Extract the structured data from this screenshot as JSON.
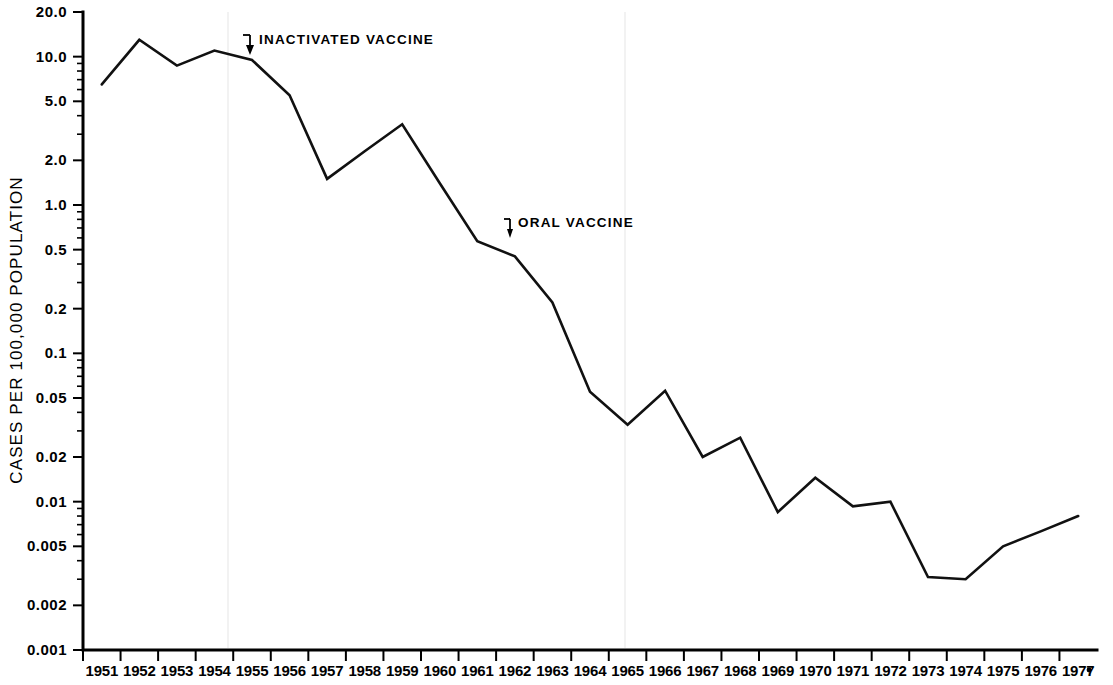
{
  "chart_data": {
    "type": "line",
    "title": "",
    "xlabel": "",
    "ylabel": "CASES PER 100,000 POPULATION",
    "yscale": "log",
    "ylim": [
      0.001,
      20.0
    ],
    "grid": false,
    "legend": null,
    "x": [
      1951,
      1952,
      1953,
      1954,
      1955,
      1956,
      1957,
      1958,
      1959,
      1960,
      1961,
      1962,
      1963,
      1964,
      1965,
      1966,
      1967,
      1968,
      1969,
      1970,
      1971,
      1972,
      1973,
      1974,
      1975,
      1976,
      1977
    ],
    "categories": [
      "1951",
      "1952",
      "1953",
      "1954",
      "1955",
      "1956",
      "1957",
      "1958",
      "1959",
      "1960",
      "1961",
      "1962",
      "1963",
      "1964",
      "1965",
      "1966",
      "1967",
      "1968",
      "1969",
      "1970",
      "1971",
      "1972",
      "1973",
      "1974",
      "1975",
      "1976",
      "1977"
    ],
    "values": [
      6.5,
      13.0,
      8.7,
      11.0,
      9.5,
      5.5,
      1.5,
      2.3,
      3.5,
      1.4,
      0.57,
      0.45,
      0.22,
      0.055,
      0.033,
      0.056,
      0.02,
      0.027,
      0.0085,
      0.0145,
      0.0093,
      0.01,
      0.0031,
      0.003,
      0.005,
      0.0063,
      0.008
    ],
    "series": [
      {
        "name": "Poliomyelitis cases per 100,000 population",
        "values": [
          6.5,
          13.0,
          8.7,
          11.0,
          9.5,
          5.5,
          1.5,
          2.3,
          3.5,
          1.4,
          0.57,
          0.45,
          0.22,
          0.055,
          0.033,
          0.056,
          0.02,
          0.027,
          0.0085,
          0.0145,
          0.0093,
          0.01,
          0.0031,
          0.003,
          0.005,
          0.0063,
          0.008
        ]
      }
    ],
    "ytick_values": [
      20.0,
      10.0,
      5.0,
      2.0,
      1.0,
      0.5,
      0.2,
      0.1,
      0.05,
      0.02,
      0.01,
      0.005,
      0.002,
      0.001
    ],
    "ytick_labels": [
      "20.0",
      "10.0",
      "5.0",
      "2.0",
      "1.0",
      "0.5",
      "0.2",
      "0.1",
      "0.05",
      "0.02",
      "0.01",
      "0.005",
      "0.002",
      "0.001"
    ],
    "annotations": [
      {
        "id": "inactivated-vaccine",
        "label": "INACTIVATED VACCINE",
        "target_x": 1955,
        "target_y": 9.5
      },
      {
        "id": "oral-vaccine",
        "label": "ORAL  VACCINE",
        "target_x": 1961.6,
        "target_y": 0.5
      }
    ],
    "line_color": "#111111",
    "background_color": "#ffffff"
  }
}
